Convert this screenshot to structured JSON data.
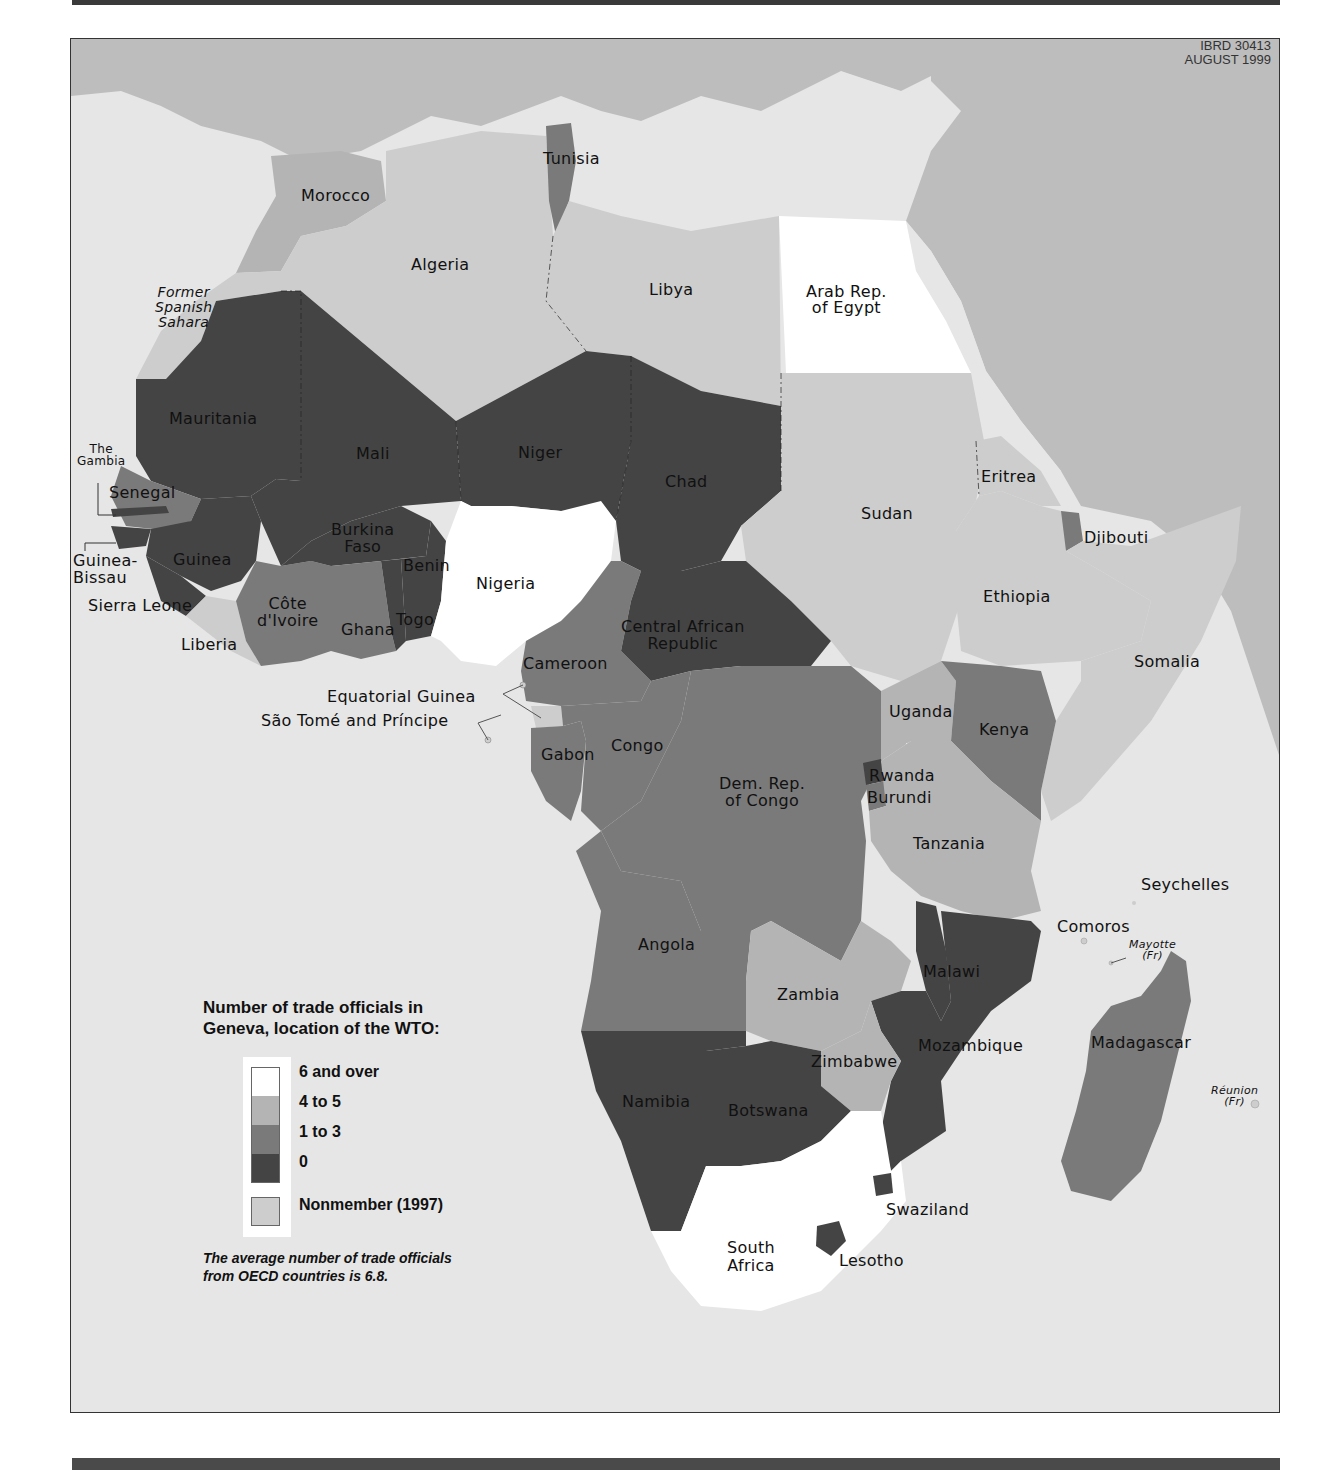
{
  "map": {
    "credit": {
      "id": "IBRD 30413",
      "date": "AUGUST 1999"
    },
    "colors": {
      "six_and_over": "#ffffff",
      "four_to_five": "#b4b4b4",
      "one_to_three": "#7a7a7a",
      "zero": "#444444",
      "nonmember": "#cdcdcd",
      "sea": "#e6e6e6",
      "outside_africa": "#bdbdbd"
    },
    "countries": [
      {
        "name": "Morocco",
        "category": "4 to 5"
      },
      {
        "name": "Algeria",
        "category": "Nonmember (1997)"
      },
      {
        "name": "Tunisia",
        "category": "1 to 3"
      },
      {
        "name": "Libya",
        "category": "Nonmember (1997)"
      },
      {
        "name": "Arab Rep. of Egypt",
        "category": "6 and over"
      },
      {
        "name": "Former Spanish Sahara",
        "category": "Nonmember (1997)"
      },
      {
        "name": "Mauritania",
        "category": "0"
      },
      {
        "name": "Mali",
        "category": "0"
      },
      {
        "name": "Niger",
        "category": "0"
      },
      {
        "name": "Chad",
        "category": "0"
      },
      {
        "name": "Sudan",
        "category": "Nonmember (1997)"
      },
      {
        "name": "Eritrea",
        "category": "Nonmember (1997)"
      },
      {
        "name": "Djibouti",
        "category": "1 to 3"
      },
      {
        "name": "Ethiopia",
        "category": "Nonmember (1997)"
      },
      {
        "name": "Somalia",
        "category": "Nonmember (1997)"
      },
      {
        "name": "Senegal",
        "category": "1 to 3"
      },
      {
        "name": "The Gambia",
        "category": "0"
      },
      {
        "name": "Guinea-Bissau",
        "category": "0"
      },
      {
        "name": "Guinea",
        "category": "0"
      },
      {
        "name": "Sierra Leone",
        "category": "0"
      },
      {
        "name": "Liberia",
        "category": "Nonmember (1997)"
      },
      {
        "name": "Côte d'Ivoire",
        "category": "1 to 3"
      },
      {
        "name": "Ghana",
        "category": "1 to 3"
      },
      {
        "name": "Burkina Faso",
        "category": "0"
      },
      {
        "name": "Togo",
        "category": "0"
      },
      {
        "name": "Benin",
        "category": "0"
      },
      {
        "name": "Nigeria",
        "category": "6 and over"
      },
      {
        "name": "Cameroon",
        "category": "1 to 3"
      },
      {
        "name": "Central African Republic",
        "category": "0"
      },
      {
        "name": "Equatorial Guinea",
        "category": "Nonmember (1997)"
      },
      {
        "name": "São Tomé and Príncipe",
        "category": "Nonmember (1997)"
      },
      {
        "name": "Gabon",
        "category": "1 to 3"
      },
      {
        "name": "Congo",
        "category": "1 to 3"
      },
      {
        "name": "Dem. Rep. of Congo",
        "category": "1 to 3"
      },
      {
        "name": "Uganda",
        "category": "4 to 5"
      },
      {
        "name": "Kenya",
        "category": "1 to 3"
      },
      {
        "name": "Rwanda",
        "category": "0"
      },
      {
        "name": "Burundi",
        "category": "1 to 3"
      },
      {
        "name": "Tanzania",
        "category": "4 to 5"
      },
      {
        "name": "Angola",
        "category": "1 to 3"
      },
      {
        "name": "Zambia",
        "category": "4 to 5"
      },
      {
        "name": "Malawi",
        "category": "0"
      },
      {
        "name": "Mozambique",
        "category": "0"
      },
      {
        "name": "Zimbabwe",
        "category": "4 to 5"
      },
      {
        "name": "Namibia",
        "category": "0"
      },
      {
        "name": "Botswana",
        "category": "0"
      },
      {
        "name": "South Africa",
        "category": "6 and over"
      },
      {
        "name": "Swaziland",
        "category": "0"
      },
      {
        "name": "Lesotho",
        "category": "0"
      },
      {
        "name": "Madagascar",
        "category": "1 to 3"
      },
      {
        "name": "Comoros",
        "category": "Nonmember (1997)"
      },
      {
        "name": "Seychelles",
        "category": "Nonmember (1997)"
      },
      {
        "name": "Mayotte (Fr)",
        "category": "Nonmember (1997)"
      },
      {
        "name": "Réunion (Fr)",
        "category": "Nonmember (1997)"
      }
    ],
    "labels": {
      "morocco": "Morocco",
      "algeria": "Algeria",
      "tunisia": "Tunisia",
      "libya": "Libya",
      "egypt_1": "Arab Rep.",
      "egypt_2": "of Egypt",
      "spanish_sahara_1": "Former",
      "spanish_sahara_2": "Spanish",
      "spanish_sahara_3": "Sahara",
      "mauritania": "Mauritania",
      "mali": "Mali",
      "niger": "Niger",
      "chad": "Chad",
      "sudan": "Sudan",
      "eritrea": "Eritrea",
      "djibouti": "Djibouti",
      "ethiopia": "Ethiopia",
      "somalia": "Somalia",
      "gambia_1": "The",
      "gambia_2": "Gambia",
      "senegal": "Senegal",
      "guinea_bissau_1": "Guinea-",
      "guinea_bissau_2": "Bissau",
      "guinea": "Guinea",
      "sierra_leone": "Sierra Leone",
      "liberia": "Liberia",
      "cote_divoire_1": "Côte",
      "cote_divoire_2": "d'Ivoire",
      "ghana": "Ghana",
      "burkina_1": "Burkina",
      "burkina_2": "Faso",
      "togo": "Togo",
      "benin": "Benin",
      "nigeria": "Nigeria",
      "cameroon": "Cameroon",
      "car_1": "Central African",
      "car_2": "Republic",
      "equatorial_guinea": "Equatorial Guinea",
      "sao_tome": "São Tomé and Príncipe",
      "gabon": "Gabon",
      "congo": "Congo",
      "drc_1": "Dem. Rep.",
      "drc_2": "of Congo",
      "uganda": "Uganda",
      "kenya": "Kenya",
      "rwanda": "Rwanda",
      "burundi": "Burundi",
      "tanzania": "Tanzania",
      "seychelles": "Seychelles",
      "comoros": "Comoros",
      "mayotte_1": "Mayotte",
      "mayotte_2": "(Fr)",
      "angola": "Angola",
      "zambia": "Zambia",
      "malawi": "Malawi",
      "mozambique": "Mozambique",
      "madagascar": "Madagascar",
      "reunion_1": "Réunion",
      "reunion_2": "(Fr)",
      "zimbabwe": "Zimbabwe",
      "namibia": "Namibia",
      "botswana": "Botswana",
      "swaziland": "Swaziland",
      "south_africa_1": "South",
      "south_africa_2": "Africa",
      "lesotho": "Lesotho"
    }
  },
  "legend": {
    "title_line1": "Number of trade officials in",
    "title_line2": "Geneva, location of the WTO:",
    "items": [
      {
        "label": "6 and over",
        "color": "#ffffff"
      },
      {
        "label": "4 to 5",
        "color": "#b4b4b4"
      },
      {
        "label": "1 to 3",
        "color": "#7a7a7a"
      },
      {
        "label": "0",
        "color": "#444444"
      },
      {
        "label": "Nonmember (1997)",
        "color": "#cdcdcd"
      }
    ],
    "note_line1": "The average number of trade officials",
    "note_line2": "from OECD countries is 6.8."
  }
}
